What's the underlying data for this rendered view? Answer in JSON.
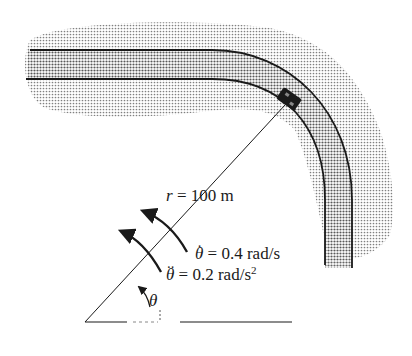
{
  "diagram": {
    "type": "kinematics-figure",
    "labels": {
      "radius_symbol": "r",
      "radius_eq": " = 100 m",
      "theta_dot_symbol": "θ",
      "theta_dot_dots": "·",
      "theta_dot_eq": " = 0.4 rad/s",
      "theta_ddot_symbol": "θ",
      "theta_ddot_dots": "··",
      "theta_ddot_eq": " = 0.2 rad/s",
      "theta_ddot_exp": "2",
      "angle_symbol": "θ"
    },
    "values": {
      "r": 100,
      "r_unit": "m",
      "theta_dot": 0.4,
      "theta_dot_unit": "rad/s",
      "theta_ddot": 0.2,
      "theta_ddot_unit": "rad/s^2"
    },
    "colors": {
      "ink": "#1a1a1a",
      "shading": "#9a9a9a",
      "road": "#7a7a7a",
      "background": "#ffffff"
    }
  }
}
